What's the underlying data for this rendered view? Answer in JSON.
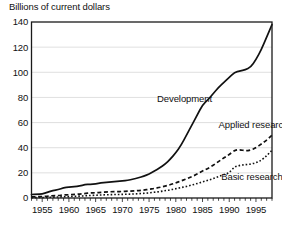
{
  "chart_data": {
    "type": "line",
    "title": "Billions of current dollars",
    "xlabel": "",
    "ylabel": "Billions of current dollars",
    "xlim": [
      1953,
      1998
    ],
    "ylim": [
      0,
      140
    ],
    "grid": true,
    "legend_position": "inline-annotations",
    "y_ticks": [
      0,
      20,
      40,
      60,
      80,
      100,
      120,
      140
    ],
    "x_ticks": [
      1955,
      1960,
      1965,
      1970,
      1975,
      1980,
      1985,
      1990,
      1995
    ],
    "x_minor_tick_interval": 1,
    "x": [
      1953,
      1954,
      1955,
      1956,
      1957,
      1958,
      1959,
      1960,
      1961,
      1962,
      1963,
      1964,
      1965,
      1966,
      1967,
      1968,
      1969,
      1970,
      1971,
      1972,
      1973,
      1974,
      1975,
      1976,
      1977,
      1978,
      1979,
      1980,
      1981,
      1982,
      1983,
      1984,
      1985,
      1986,
      1987,
      1988,
      1989,
      1990,
      1991,
      1992,
      1993,
      1994,
      1995,
      1996,
      1997,
      1998
    ],
    "series": [
      {
        "name": "Development",
        "style": "solid",
        "color": "#111111",
        "values": [
          2.8,
          3.0,
          3.2,
          4.6,
          6.0,
          6.6,
          8.2,
          8.6,
          9.0,
          9.6,
          10.6,
          11.0,
          11.2,
          12.0,
          12.4,
          12.8,
          13.2,
          13.6,
          14.0,
          15.0,
          16.0,
          17.4,
          19.0,
          21.5,
          24.0,
          27.0,
          31.0,
          36.0,
          42.0,
          50.0,
          58.0,
          66.0,
          74.0,
          78.0,
          83.0,
          88.0,
          92.0,
          96.0,
          100.0,
          101.0,
          102.0,
          104.0,
          110.0,
          118.0,
          128.0,
          138.0
        ]
      },
      {
        "name": "Applied research",
        "style": "dashed",
        "color": "#111111",
        "values": [
          0.9,
          1.0,
          1.1,
          1.4,
          1.8,
          2.0,
          2.4,
          2.6,
          2.9,
          3.2,
          3.6,
          4.0,
          4.2,
          4.5,
          4.8,
          5.0,
          5.1,
          5.2,
          5.4,
          5.6,
          5.9,
          6.3,
          6.9,
          7.6,
          8.4,
          9.4,
          10.6,
          12.0,
          13.6,
          15.2,
          17.0,
          19.0,
          21.5,
          23.5,
          26.0,
          29.0,
          32.0,
          34.5,
          38.0,
          38.5,
          37.5,
          38.0,
          40.0,
          43.0,
          46.0,
          50.0
        ]
      },
      {
        "name": "Basic research",
        "style": "dotted",
        "color": "#111111",
        "values": [
          0.3,
          0.35,
          0.4,
          0.5,
          0.7,
          0.8,
          1.0,
          1.1,
          1.3,
          1.5,
          1.8,
          2.0,
          2.2,
          2.4,
          2.6,
          2.7,
          2.8,
          2.9,
          3.0,
          3.2,
          3.4,
          3.7,
          4.1,
          4.6,
          5.1,
          5.8,
          6.5,
          7.4,
          8.3,
          9.2,
          10.3,
          11.5,
          12.8,
          14.0,
          15.4,
          17.0,
          18.6,
          20.0,
          25.0,
          26.0,
          26.5,
          27.0,
          28.0,
          30.0,
          33.5,
          38.0
        ]
      }
    ],
    "annotations": [
      {
        "text": "Development",
        "x": 1976.5,
        "y": 76
      },
      {
        "text": "Applied research",
        "x": 1988.0,
        "y": 56
      },
      {
        "text": "Basic research",
        "x": 1988.5,
        "y": 14
      }
    ]
  }
}
